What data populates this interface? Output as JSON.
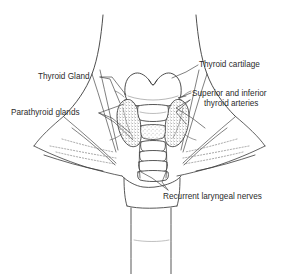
{
  "figure": {
    "type": "anatomical-line-drawing",
    "background_color": "#ffffff",
    "line_color": "#3a3a3a",
    "text_color": "#2b2b2b"
  },
  "labels": {
    "thyroid_cartilage": "Thyroid cartilage",
    "arteries_line1": "Superior and inferior",
    "arteries_line2": "thyroid arteries",
    "thyroid_gland": "Thyroid Gland",
    "parathyroid_glands": "Parathyroid glands",
    "recurrent_laryngeal_nerves": "Recurrent laryngeal nerves"
  }
}
